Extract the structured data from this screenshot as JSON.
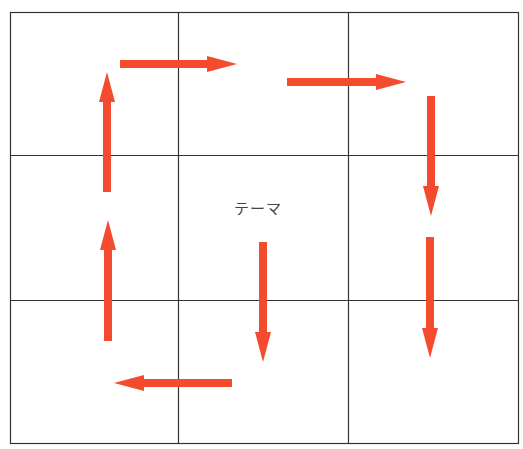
{
  "diagram": {
    "type": "3x3 grid with cyclic arrows",
    "center_label": "テーマ",
    "grid": {
      "rows": 3,
      "cols": 3,
      "line_color": "#333333"
    },
    "arrow_color": "#f44a2e",
    "arrows": [
      {
        "id": "top-left-right",
        "direction": "right"
      },
      {
        "id": "top-right-right",
        "direction": "right"
      },
      {
        "id": "right-upper-down",
        "direction": "down"
      },
      {
        "id": "right-lower-down",
        "direction": "down"
      },
      {
        "id": "center-down",
        "direction": "down"
      },
      {
        "id": "bottom-left",
        "direction": "left"
      },
      {
        "id": "left-lower-up",
        "direction": "up"
      },
      {
        "id": "left-upper-up",
        "direction": "up"
      }
    ]
  }
}
